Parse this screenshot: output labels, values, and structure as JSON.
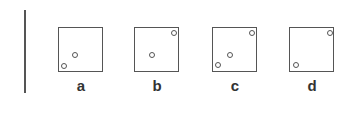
{
  "colors": {
    "stroke": "#555555",
    "text": "#333333",
    "background": "#ffffff"
  },
  "panels": [
    {
      "label": "a",
      "left": 58,
      "dots": [
        {
          "x": 16,
          "y": 27
        },
        {
          "x": 5,
          "y": 38
        }
      ]
    },
    {
      "label": "b",
      "left": 134,
      "dots": [
        {
          "x": 17,
          "y": 27
        },
        {
          "x": 39,
          "y": 5
        }
      ]
    },
    {
      "label": "c",
      "left": 212,
      "dots": [
        {
          "x": 39,
          "y": 5
        },
        {
          "x": 17,
          "y": 27
        },
        {
          "x": 5,
          "y": 37
        }
      ]
    },
    {
      "label": "d",
      "left": 289,
      "dots": [
        {
          "x": 40,
          "y": 5
        },
        {
          "x": 6,
          "y": 37
        }
      ]
    }
  ]
}
